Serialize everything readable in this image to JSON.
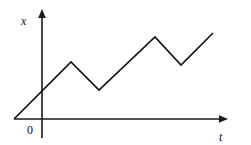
{
  "figure": {
    "background_color": "#ffffff",
    "ink_color": "#141414",
    "width": 251,
    "height": 145
  },
  "axes": {
    "y_axis_label": "x",
    "x_axis_label": "t",
    "origin_label": "0",
    "y_axis_x_px": 42,
    "y_axis_top_px": 9,
    "y_axis_bottom_px": 138,
    "x_axis_y_px": 119,
    "x_axis_left_px": 14,
    "x_axis_right_px": 228,
    "arrows": [
      "y-axis-arrow-up",
      "x-axis-arrow-right"
    ],
    "ticks": [],
    "tick_labels": []
  },
  "chart_data": {
    "type": "line",
    "title": "",
    "subtitle": "",
    "xlabel": "t",
    "ylabel": "x",
    "legend": [],
    "legend_position": "none",
    "grid": false,
    "axis_style": "arrow-axes",
    "xlim": [
      0,
      214
    ],
    "ylim": [
      0,
      100
    ],
    "series": [
      {
        "name": "displacement",
        "points_px": [
          {
            "x": 14,
            "y": 119
          },
          {
            "x": 71,
            "y": 62
          },
          {
            "x": 99,
            "y": 90
          },
          {
            "x": 155,
            "y": 37
          },
          {
            "x": 181,
            "y": 65
          },
          {
            "x": 213,
            "y": 33
          }
        ],
        "x": [
          -28,
          29,
          57,
          113,
          139,
          171
        ],
        "values": [
          0,
          57,
          29,
          82,
          54,
          86
        ],
        "vertex_types": [
          "start",
          "maximum",
          "minimum",
          "maximum",
          "minimum",
          "end"
        ]
      }
    ]
  }
}
